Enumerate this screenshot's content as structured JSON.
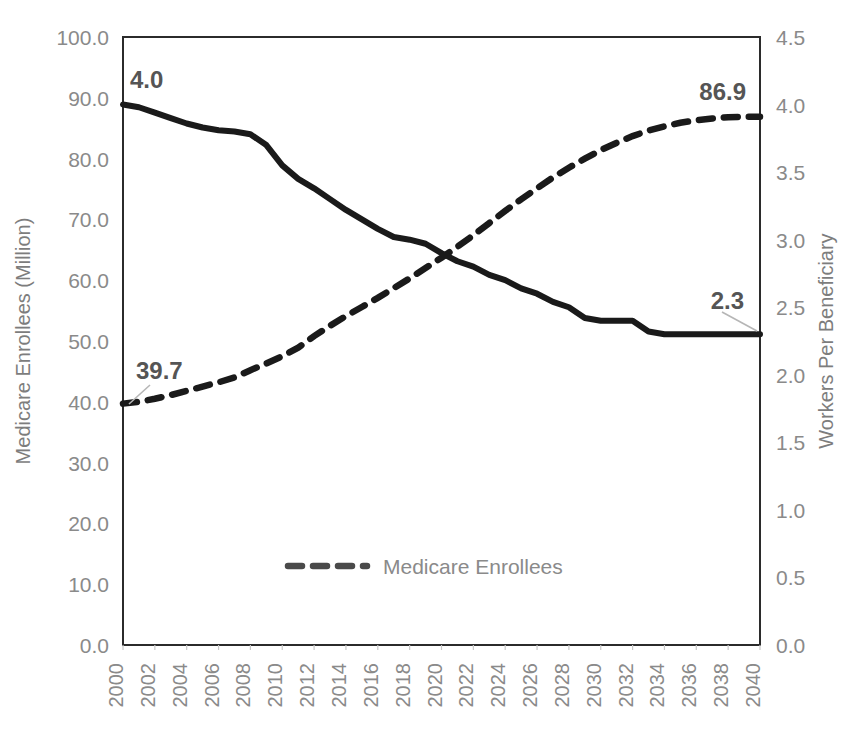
{
  "chart_data": {
    "type": "line",
    "title": "",
    "subtitle": "",
    "xlabel": "",
    "ylabel": "Medicare Enrollees (Million)",
    "ylabel_secondary": "Workers Per Beneficiary",
    "grid": false,
    "legend_position": "bottom-center",
    "x": [
      2000,
      2001,
      2002,
      2003,
      2004,
      2005,
      2006,
      2007,
      2008,
      2009,
      2010,
      2011,
      2012,
      2013,
      2014,
      2015,
      2016,
      2017,
      2018,
      2019,
      2020,
      2021,
      2022,
      2023,
      2024,
      2025,
      2026,
      2027,
      2028,
      2029,
      2030,
      2031,
      2032,
      2033,
      2034,
      2035,
      2036,
      2037,
      2038,
      2039,
      2040
    ],
    "xticks": [
      "2000",
      "2002",
      "2004",
      "2006",
      "2008",
      "2010",
      "2012",
      "2014",
      "2016",
      "2018",
      "2020",
      "2022",
      "2024",
      "2026",
      "2028",
      "2030",
      "2032",
      "2034",
      "2036",
      "2038",
      "2040"
    ],
    "xlim": [
      2000,
      2040
    ],
    "ylim": [
      0,
      100
    ],
    "yticks": [
      "0.0",
      "10.0",
      "20.0",
      "30.0",
      "40.0",
      "50.0",
      "60.0",
      "70.0",
      "80.0",
      "90.0",
      "100.0"
    ],
    "ylim_secondary": [
      0,
      4.5
    ],
    "yticks_secondary": [
      "0.0",
      "0.5",
      "1.0",
      "1.5",
      "2.0",
      "2.5",
      "3.0",
      "3.5",
      "4.0",
      "4.5"
    ],
    "series": [
      {
        "name": "Medicare Enrollees",
        "axis": "left",
        "style": "dashed",
        "unit": "Million",
        "color": "#1a1a1a",
        "values": [
          39.7,
          40.0,
          40.5,
          41.1,
          41.8,
          42.5,
          43.2,
          44.0,
          45.2,
          46.3,
          47.5,
          48.9,
          50.8,
          52.5,
          54.1,
          55.6,
          57.1,
          58.7,
          60.3,
          62.0,
          63.7,
          65.5,
          67.4,
          69.4,
          71.4,
          73.3,
          75.1,
          76.9,
          78.5,
          80.0,
          81.4,
          82.6,
          83.7,
          84.6,
          85.3,
          85.9,
          86.3,
          86.6,
          86.8,
          86.9,
          86.9
        ]
      },
      {
        "name": "Workers Per Beneficiary",
        "axis": "right",
        "style": "solid",
        "unit": "workers",
        "color": "#1a1a1a",
        "values": [
          4.0,
          3.98,
          3.94,
          3.9,
          3.86,
          3.83,
          3.81,
          3.8,
          3.78,
          3.7,
          3.55,
          3.45,
          3.38,
          3.3,
          3.22,
          3.15,
          3.08,
          3.02,
          3.0,
          2.97,
          2.9,
          2.84,
          2.8,
          2.74,
          2.7,
          2.64,
          2.6,
          2.54,
          2.5,
          2.42,
          2.4,
          2.4,
          2.4,
          2.32,
          2.3,
          2.3,
          2.3,
          2.3,
          2.3,
          2.3,
          2.3
        ]
      }
    ],
    "annotations": [
      {
        "text": "4.0",
        "series": "Workers Per Beneficiary",
        "x": 2000,
        "value": 4.0,
        "position": "above-right"
      },
      {
        "text": "86.9",
        "series": "Medicare Enrollees",
        "x": 2040,
        "value": 86.9,
        "position": "above-left"
      },
      {
        "text": "39.7",
        "series": "Medicare Enrollees",
        "x": 2000,
        "value": 39.7,
        "position": "above-right",
        "leader": true
      },
      {
        "text": "2.3",
        "series": "Workers Per Beneficiary",
        "x": 2040,
        "value": 2.3,
        "position": "above-left",
        "leader": true
      }
    ],
    "legend": [
      {
        "label": "Medicare Enrollees",
        "style": "dashed",
        "color": "#4a4a4a"
      }
    ]
  },
  "colors": {
    "axis_line": "#2b2b2b",
    "tick_label": "#8a8a8a",
    "axis_title": "#7d7d7d",
    "annotation": "#555555",
    "series_line": "#1a1a1a",
    "leader_line": "#b6b6b6",
    "background": "#ffffff"
  }
}
